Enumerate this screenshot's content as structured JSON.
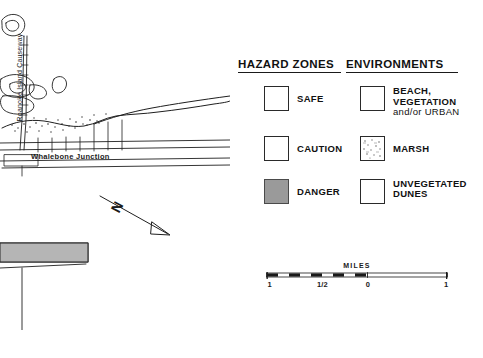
{
  "map": {
    "labels": {
      "causeway": "Roanoke Island Causeway",
      "junction": "Whalebone Junction",
      "north_arrow": "N"
    }
  },
  "legend": {
    "headers": {
      "hazard": "HAZARD ZONES",
      "environments": "ENVIRONMENTS"
    },
    "hazard_items": [
      {
        "label": "SAFE",
        "swatch": "white-box",
        "fill": "#ffffff"
      },
      {
        "label": "CAUTION",
        "swatch": "white-box",
        "fill": "#ffffff"
      },
      {
        "label": "DANGER",
        "swatch": "gray-box",
        "fill": "#9a9a9a"
      }
    ],
    "environment_items": [
      {
        "label_lines": [
          "BEACH,",
          "VEGETATION",
          "and/or URBAN"
        ],
        "swatch": "white-box",
        "fill": "#ffffff"
      },
      {
        "label_lines": [
          "MARSH"
        ],
        "swatch": "speckled-box",
        "fill": "#ffffff"
      },
      {
        "label_lines": [
          "UNVEGETATED",
          "DUNES"
        ],
        "swatch": "white-box",
        "fill": "#ffffff"
      }
    ]
  },
  "scale": {
    "title": "MILES",
    "tick_labels": [
      "1",
      "1/2",
      "0",
      "1"
    ],
    "tick_positions_pct": [
      1,
      33,
      56,
      99
    ]
  },
  "colors": {
    "ink": "#1a1a1a",
    "danger_gray": "#9a9a9a",
    "paper": "#ffffff"
  }
}
